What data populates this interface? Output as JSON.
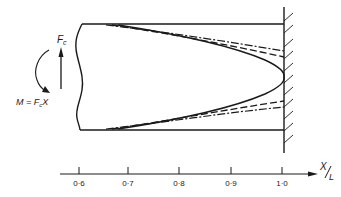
{
  "diagram": {
    "type": "cantilever-stress-distribution",
    "force_label": "F",
    "force_subscript": "c",
    "moment_label_prefix": "M = F",
    "moment_label_subscript": "c",
    "moment_label_suffix": "X",
    "axis": {
      "label_numerator": "X",
      "label_denominator": "L",
      "ticks": [
        {
          "value": 0.6,
          "label": "0·6"
        },
        {
          "value": 0.7,
          "label": "0·7"
        },
        {
          "value": 0.8,
          "label": "0·8"
        },
        {
          "value": 0.9,
          "label": "0·9"
        },
        {
          "value": 1.0,
          "label": "1·0"
        }
      ]
    },
    "curves": [
      {
        "name": "solid",
        "style": "solid"
      },
      {
        "name": "dashed",
        "style": "dashed"
      },
      {
        "name": "dash-dot",
        "style": "dash-dot"
      }
    ],
    "colors": {
      "ink": "#1a1a1a",
      "background": "#ffffff"
    }
  }
}
